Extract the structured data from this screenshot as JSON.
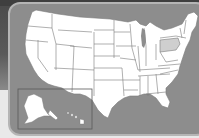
{
  "map": {
    "title": "United States",
    "highlighted_state": "Pennsylvania",
    "inset_labels": [
      "Alaska",
      "Hawaii"
    ],
    "colors": {
      "panel": "#8d8d8d",
      "panel_border": "#b5b5b5",
      "state_fill": "#ffffff",
      "state_border": "#7a7a7a",
      "highlight_fill": "#cfcfcf",
      "background_dark": "#4a4a4a",
      "background_light": "#e9e9e9"
    }
  }
}
